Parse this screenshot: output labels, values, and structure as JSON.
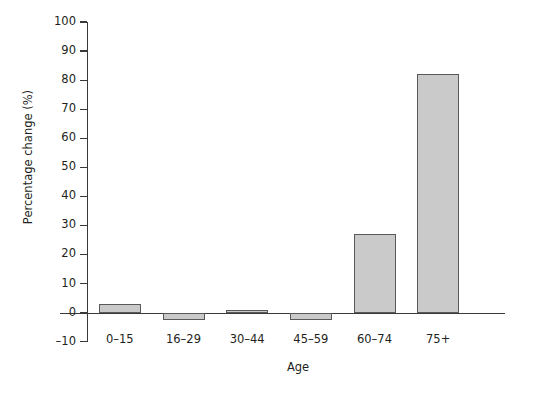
{
  "chart_data": {
    "type": "bar",
    "title": "",
    "xlabel": "Age",
    "ylabel": "Percentage change (%)",
    "categories": [
      "0–15",
      "16–29",
      "30–44",
      "45–59",
      "60–74",
      "75+"
    ],
    "values": [
      3,
      -2.5,
      1,
      -2.5,
      27,
      82
    ],
    "ylim": [
      -10,
      100
    ],
    "ytick_step": 10,
    "yticks": [
      100,
      90,
      80,
      70,
      60,
      50,
      40,
      30,
      20,
      10,
      0,
      -10
    ],
    "ytick_labels": [
      "100",
      "90",
      "80",
      "70",
      "60",
      "50",
      "40",
      "30",
      "20",
      "10",
      "0",
      "–10"
    ],
    "grid": false,
    "legend": null,
    "bar_fill_color": "#cacaca",
    "bar_edge_color": "#58595b",
    "axis_color": "#3a3a3a",
    "text_color": "#231f20"
  }
}
